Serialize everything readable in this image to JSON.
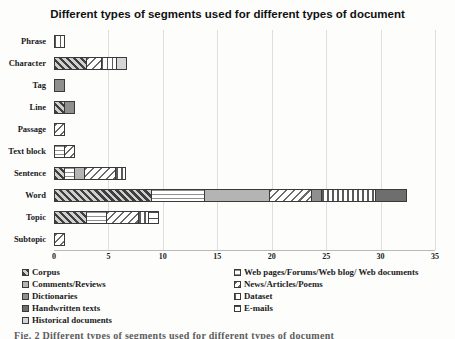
{
  "caption": "Fig. 2 Different types of segments used for different types of document",
  "chart_data": {
    "type": "bar",
    "orientation": "horizontal-stacked",
    "title": "Different types of segments used for different types of document",
    "xlabel": "",
    "ylabel": "",
    "xlim": [
      0,
      35
    ],
    "x_ticks": [
      0,
      5,
      10,
      15,
      20,
      25,
      30,
      35
    ],
    "grid": "vertical-light",
    "gridline_color": "#dedede",
    "legend_position": "bottom-two-columns",
    "legend_columns": [
      [
        0,
        2,
        4,
        6,
        8
      ],
      [
        1,
        3,
        5,
        7
      ]
    ],
    "categories": [
      "Phrase",
      "Character",
      "Tag",
      "Line",
      "Passage",
      "Text block",
      "Sentence",
      "Word",
      "Topic",
      "Subtopic"
    ],
    "series": [
      {
        "name": "Corpus",
        "pattern": "diag-dark",
        "color": "#3f3f3f",
        "values": [
          0,
          3,
          0,
          1,
          0,
          0,
          1,
          9,
          3,
          0
        ]
      },
      {
        "name": "Web pages/Forums/Web blog/ Web documents",
        "pattern": "hlines-thin",
        "color": "#8f8f8f",
        "values": [
          0,
          0,
          0,
          0,
          0,
          1,
          1,
          5,
          2,
          0
        ]
      },
      {
        "name": "Comments/Reviews",
        "pattern": "solid-light",
        "color": "#b4b4b4",
        "values": [
          0,
          0,
          0,
          0,
          0,
          0,
          1,
          6,
          0,
          0
        ]
      },
      {
        "name": "News/Articles/Poems",
        "pattern": "diag-light",
        "color": "#6a6a6a",
        "values": [
          0,
          1.5,
          0,
          0,
          1,
          1,
          3,
          4,
          3,
          1
        ]
      },
      {
        "name": "Dictionaries",
        "pattern": "solid-medium",
        "color": "#8f8f8f",
        "values": [
          0,
          0,
          1,
          1,
          0,
          0,
          0,
          1,
          0,
          0
        ]
      },
      {
        "name": "Dataset",
        "pattern": "vlines",
        "color": "#5a5a5a",
        "values": [
          1,
          1.5,
          0,
          0,
          0,
          0,
          1,
          5,
          1,
          0
        ]
      },
      {
        "name": "Handwritten texts",
        "pattern": "solid-dark",
        "color": "#6e6e6e",
        "values": [
          0,
          0,
          0,
          0,
          0,
          0,
          0,
          3,
          0,
          0
        ]
      },
      {
        "name": "E-mails",
        "pattern": "hlines-sparse",
        "color": "#4a4a4a",
        "values": [
          0,
          0,
          0,
          0,
          0,
          0,
          0,
          0,
          1,
          0
        ]
      },
      {
        "name": "Historical documents",
        "pattern": "solid-verylight",
        "color": "#d5d5d5",
        "values": [
          0,
          1,
          0,
          0,
          0,
          0,
          0,
          0,
          0,
          0
        ]
      }
    ]
  }
}
